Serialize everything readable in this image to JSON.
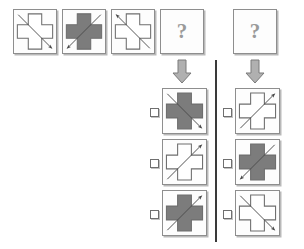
{
  "puzzle": {
    "title": "Figural analogy matrix item",
    "unknown_symbol": "?",
    "colors": {
      "cross_fill_gray": "#7c7c7c",
      "cross_fill_white": "#ffffff",
      "cross_stroke": "#6e6e6e",
      "arrow_stroke": "#4a4a4a",
      "tile_border": "#8e8e8e",
      "tile_shadow": "#b9b9b9",
      "block_arrow_fill": "#b0b0b0",
      "block_arrow_stroke": "#7a7a7a",
      "divider": "#3a3a3a",
      "background": "#ffffff"
    }
  },
  "sequence": {
    "name": "stimulus-row",
    "cells": [
      {
        "id": "stim-1",
        "fill": "white",
        "arrow": "down-right",
        "label": "white cross with arrow pointing down-right"
      },
      {
        "id": "stim-2",
        "fill": "gray",
        "arrow": "down-left",
        "label": "gray cross with arrow pointing down-left"
      },
      {
        "id": "stim-3",
        "fill": "white",
        "arrow": "up-left",
        "label": "white cross with arrow pointing up-left"
      },
      {
        "id": "stim-4",
        "fill": "none",
        "arrow": "none",
        "label": "unknown",
        "text": "?"
      }
    ],
    "second_prompt": {
      "id": "stim-5",
      "fill": "none",
      "arrow": "none",
      "label": "unknown",
      "text": "?"
    }
  },
  "answers": {
    "left_column": {
      "name": "answer-column-left",
      "options": [
        {
          "id": "left-option-1",
          "fill": "gray",
          "arrow": "down-right",
          "label": "gray cross with arrow pointing down-right",
          "checked": false
        },
        {
          "id": "left-option-2",
          "fill": "white",
          "arrow": "up-right",
          "label": "white cross with arrow pointing up-right",
          "checked": false
        },
        {
          "id": "left-option-3",
          "fill": "gray",
          "arrow": "up-right",
          "label": "gray cross with arrow pointing up-right",
          "checked": false
        }
      ]
    },
    "right_column": {
      "name": "answer-column-right",
      "options": [
        {
          "id": "right-option-1",
          "fill": "white",
          "arrow": "up-right",
          "label": "white cross with arrow pointing up-right",
          "checked": false
        },
        {
          "id": "right-option-2",
          "fill": "gray",
          "arrow": "down-left",
          "label": "gray cross with arrow pointing down-left",
          "checked": false
        },
        {
          "id": "right-option-3",
          "fill": "white",
          "arrow": "down-right",
          "label": "white cross with arrow pointing down-right",
          "checked": false
        }
      ]
    }
  }
}
